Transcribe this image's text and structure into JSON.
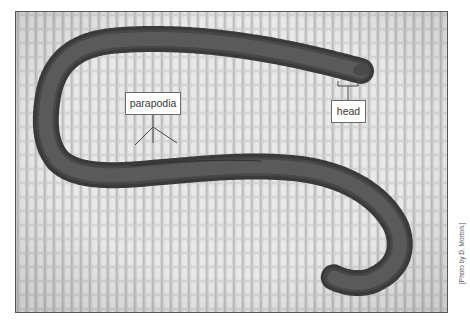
{
  "figure": {
    "labels": {
      "parapodia": "parapodia",
      "head": "head"
    },
    "credit": "[Photo by D. Morton.]",
    "colors": {
      "background_cloth": "#d9d9d9",
      "cloth_highlight": "#ebebeb",
      "cloth_shadow": "#b9b9b9",
      "worm_body": "#474747",
      "worm_dark": "#2e2e2e",
      "frame_border": "#555555",
      "label_border": "#6a6a6a",
      "leader_line": "#4a4a4a"
    }
  }
}
